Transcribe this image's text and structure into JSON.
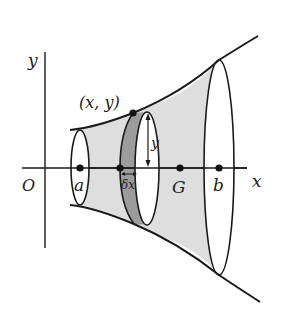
{
  "figure": {
    "labels": {
      "y_axis": "y",
      "x_axis": "x",
      "origin": "O",
      "point": "(x, y)",
      "lower_limit": "a",
      "upper_limit": "b",
      "centroid": "G",
      "radius": "y",
      "slice_width": "δx"
    },
    "colors": {
      "stroke": "#1a1a1a",
      "solid_fill": "#dcdcdc",
      "slice_fill": "#9a9a9a",
      "background": "#ffffff"
    }
  }
}
